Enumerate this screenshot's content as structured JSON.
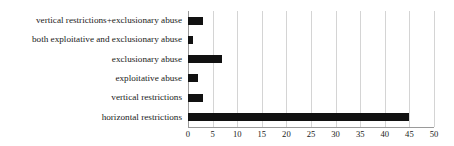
{
  "chart_data": {
    "type": "bar",
    "orientation": "horizontal",
    "title": "",
    "xlabel": "",
    "ylabel": "",
    "categories": [
      "vertical restrictions+exclusionary abuse",
      "both exploitative and exclusionary abuse",
      "exclusionary abuse",
      "exploitative abuse",
      "vertical restrictions",
      "horizontal restrictions"
    ],
    "values": [
      3,
      1,
      7,
      2,
      3,
      45
    ],
    "xlim": [
      0,
      50
    ],
    "xticks": [
      0,
      5,
      10,
      15,
      20,
      25,
      30,
      35,
      40,
      45,
      50
    ],
    "xtick_labels": [
      "0",
      "5",
      "10",
      "15",
      "20",
      "25",
      "30",
      "35",
      "40",
      "45",
      "50"
    ],
    "grid": true,
    "grid_axis": "x",
    "legend": false,
    "bar_color": "#111111",
    "grid_color": "#d4d4d4",
    "axis_color": "#9a9a9a",
    "background_color": "#ffffff"
  }
}
